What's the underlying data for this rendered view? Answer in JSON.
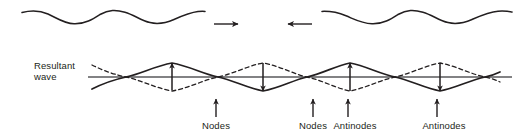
{
  "figure": {
    "type": "physics-diagram",
    "background_color": "#ffffff",
    "stroke_color": "#231f20",
    "axis_color": "#58595b",
    "width": 528,
    "height": 138
  },
  "labels": {
    "resultant_wave_line1": "Resultant",
    "resultant_wave_line2": "wave",
    "nodes_1": "Nodes",
    "nodes_2": "Nodes",
    "antinodes_1": "Antinodes",
    "antinodes_2": "Antinodes"
  },
  "travelling_waves": {
    "left_wave": {
      "direction_icon": "arrow-right-icon",
      "direction": "right",
      "x_start": 22,
      "x_end": 205,
      "baseline_y": 17,
      "amplitude": 7,
      "wavelength": 89
    },
    "right_wave": {
      "direction_icon": "arrow-left-icon",
      "direction": "left",
      "x_start": 322,
      "x_end": 512,
      "baseline_y": 17,
      "amplitude": 7,
      "wavelength": 89
    },
    "arrow_right": {
      "x1": 214,
      "x2": 240,
      "y": 24
    },
    "arrow_left": {
      "x1": 312,
      "x2": 286,
      "y": 24
    }
  },
  "standing_wave": {
    "axis_y": 77,
    "axis_x_start": 88,
    "axis_x_end": 512,
    "amplitude": 14,
    "wavelength": 178,
    "solid_curve_x_start": 92,
    "solid_curve_x_end": 500,
    "dashed_curve_x_start": 92,
    "dashed_curve_x_end": 500,
    "node_positions_x": [
      126,
      218,
      307,
      395,
      485
    ],
    "antinode_positions_x": [
      172,
      263,
      350,
      440
    ]
  },
  "amplitude_arrows": [
    {
      "name": "antinode-arrow-up-1",
      "x": 172,
      "y_from": 77,
      "y_to": 63,
      "direction": "up"
    },
    {
      "name": "antinode-arrow-down-1",
      "x": 263,
      "y_from": 63,
      "y_to": 91,
      "direction": "down"
    },
    {
      "name": "antinode-arrow-up-2",
      "x": 350,
      "y_from": 91,
      "y_to": 63,
      "direction": "up"
    },
    {
      "name": "antinode-arrow-down-2",
      "x": 440,
      "y_from": 63,
      "y_to": 91,
      "direction": "down"
    }
  ],
  "callouts": [
    {
      "name": "nodes-callout-1",
      "label_key": "nodes_1",
      "pointer_x": 216,
      "pointer_y_bottom": 116,
      "pointer_y_top": 98,
      "text_x": 216,
      "text_y": 120
    },
    {
      "name": "nodes-callout-2",
      "label_key": "nodes_2",
      "pointer_x": 313,
      "pointer_y_bottom": 116,
      "pointer_y_top": 98,
      "text_x": 313,
      "text_y": 120
    },
    {
      "name": "antinodes-callout-1",
      "label_key": "antinodes_1",
      "pointer_x": 348,
      "pointer_y_bottom": 116,
      "pointer_y_top": 98,
      "text_x": 355,
      "text_y": 120
    },
    {
      "name": "antinodes-callout-2",
      "label_key": "antinodes_2",
      "pointer_x": 437,
      "pointer_y_bottom": 116,
      "pointer_y_top": 98,
      "text_x": 444,
      "text_y": 120
    }
  ]
}
